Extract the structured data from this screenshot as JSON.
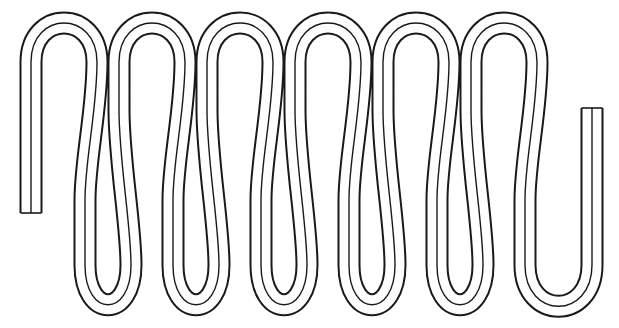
{
  "diagram": {
    "type": "serpentine-coil",
    "stroke_color": "#1a1a1a",
    "fill_color": "#ffffff",
    "upper_loop_count": 6,
    "lower_loop_count": 6,
    "left_end": {
      "x": 31,
      "y_bottom": 213
    },
    "right_end": {
      "x": 592,
      "y_top": 108
    }
  }
}
